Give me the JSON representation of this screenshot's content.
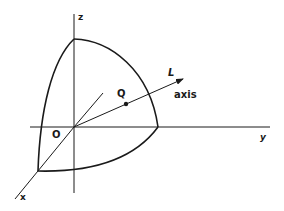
{
  "figure": {
    "type": "3d-coordinate-diagram",
    "colors": {
      "ink": "#1a1a1a",
      "background": "#ffffff"
    }
  },
  "labels": {
    "z_axis": "z",
    "y_axis": "y",
    "x_axis": "x",
    "origin": "O",
    "point": "Q",
    "axis_name": "L",
    "axis_caption": "axis"
  }
}
